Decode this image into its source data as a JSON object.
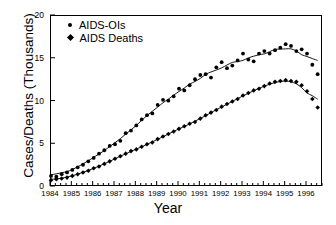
{
  "chart_data": {
    "type": "scatter",
    "title": "",
    "xlabel": "Year",
    "ylabel": "Cases/Deaths (Thousands)",
    "xlim": [
      1984.0,
      1996.75
    ],
    "ylim": [
      0,
      20
    ],
    "yticks": [
      0,
      5,
      10,
      15,
      20
    ],
    "ytick_labels": [
      "0",
      "5",
      "10",
      "15",
      "20"
    ],
    "xticks": [
      1984,
      1985,
      1986,
      1987,
      1988,
      1989,
      1990,
      1991,
      1992,
      1993,
      1994,
      1995,
      1996
    ],
    "xtick_labels": [
      "1984",
      "1985",
      "1986",
      "1987",
      "1988",
      "1989",
      "1990",
      "1991",
      "1992",
      "1993",
      "1994",
      "1995",
      "1996"
    ],
    "minor_xtick_interval": 0.25,
    "grid": false,
    "legend_position": "top-left",
    "series": [
      {
        "name": "AIDS-OIs",
        "marker": "circle",
        "color": "#000000",
        "has_trend_line": true,
        "x": [
          1984.0,
          1984.25,
          1984.5,
          1984.75,
          1985.0,
          1985.25,
          1985.5,
          1985.75,
          1986.0,
          1986.25,
          1986.5,
          1986.75,
          1987.0,
          1987.25,
          1987.5,
          1987.75,
          1988.0,
          1988.25,
          1988.5,
          1988.75,
          1989.0,
          1989.25,
          1989.5,
          1989.75,
          1990.0,
          1990.25,
          1990.5,
          1990.75,
          1991.0,
          1991.25,
          1991.5,
          1991.75,
          1992.0,
          1992.25,
          1992.5,
          1992.75,
          1993.0,
          1993.25,
          1993.5,
          1993.75,
          1994.0,
          1994.25,
          1994.5,
          1994.75,
          1995.0,
          1995.25,
          1995.5,
          1995.75,
          1996.0,
          1996.25,
          1996.5
        ],
        "y": [
          1.3,
          1.2,
          1.5,
          1.7,
          2.0,
          2.3,
          2.6,
          3.0,
          3.4,
          3.9,
          4.3,
          4.8,
          5.0,
          5.4,
          6.3,
          6.6,
          7.2,
          7.9,
          8.4,
          8.6,
          9.6,
          10.2,
          10.1,
          10.6,
          11.5,
          11.3,
          11.9,
          12.6,
          13.1,
          13.2,
          12.8,
          14.0,
          14.6,
          13.9,
          14.2,
          14.8,
          15.6,
          14.9,
          14.7,
          15.6,
          15.9,
          15.6,
          16.0,
          16.3,
          16.7,
          16.5,
          15.9,
          16.1,
          15.6,
          14.3,
          13.2
        ]
      },
      {
        "name": "AIDS Deaths",
        "marker": "diamond",
        "color": "#000000",
        "has_trend_line": true,
        "x": [
          1984.0,
          1984.25,
          1984.5,
          1984.75,
          1985.0,
          1985.25,
          1985.5,
          1985.75,
          1986.0,
          1986.25,
          1986.5,
          1986.75,
          1987.0,
          1987.25,
          1987.5,
          1987.75,
          1988.0,
          1988.25,
          1988.5,
          1988.75,
          1989.0,
          1989.25,
          1989.5,
          1989.75,
          1990.0,
          1990.25,
          1990.5,
          1990.75,
          1991.0,
          1991.25,
          1991.5,
          1991.75,
          1992.0,
          1992.25,
          1992.5,
          1992.75,
          1993.0,
          1993.25,
          1993.5,
          1993.75,
          1994.0,
          1994.25,
          1994.5,
          1994.75,
          1995.0,
          1995.25,
          1995.5,
          1995.75,
          1996.0,
          1996.25,
          1996.5
        ],
        "y": [
          0.8,
          0.9,
          1.0,
          1.1,
          1.3,
          1.5,
          1.7,
          1.9,
          2.2,
          2.4,
          2.7,
          3.0,
          3.3,
          3.6,
          3.9,
          4.2,
          4.4,
          4.7,
          5.0,
          5.2,
          5.6,
          5.9,
          6.2,
          6.5,
          6.8,
          7.1,
          7.4,
          7.6,
          8.0,
          8.4,
          8.7,
          9.0,
          9.4,
          9.7,
          10.0,
          10.3,
          10.7,
          11.0,
          11.3,
          11.5,
          11.8,
          12.1,
          12.3,
          12.4,
          12.5,
          12.4,
          12.3,
          11.9,
          11.2,
          10.3,
          9.3
        ]
      }
    ]
  },
  "legend": {
    "items": [
      {
        "label": "AIDS-OIs",
        "marker": "circle"
      },
      {
        "label": "AIDS Deaths",
        "marker": "diamond"
      }
    ]
  }
}
